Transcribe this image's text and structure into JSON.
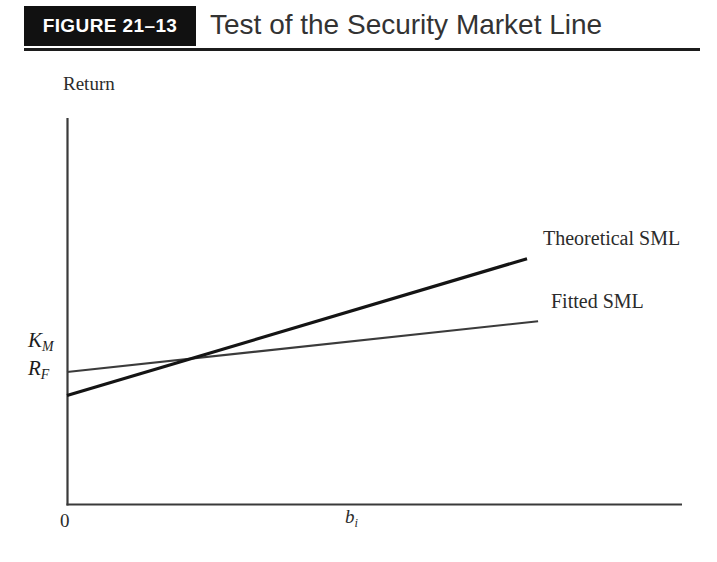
{
  "header": {
    "figure_number": "FIGURE 21–13",
    "title": "Test of the Security Market Line",
    "box_color": "#111111",
    "box_text_color": "#ffffff",
    "title_color": "#333333",
    "rule_color": "#1c1c1c"
  },
  "axes": {
    "y_title": "Return",
    "x_origin_label": "0",
    "x_variable": "b",
    "x_variable_subscript": "i",
    "axis_color": "#3a3a3a"
  },
  "value_labels": [
    {
      "name": "km",
      "symbol": "K",
      "subscript": "M"
    },
    {
      "name": "rf",
      "symbol": "R",
      "subscript": "F"
    }
  ],
  "series_labels": {
    "theoretical": "Theoretical SML",
    "fitted": "Fitted SML"
  },
  "chart_data": {
    "type": "line",
    "title": "Test of the Security Market Line",
    "subtitle": "",
    "xlabel": "b_i",
    "ylabel": "Return",
    "grid": false,
    "legend_position": "right-inline-labels",
    "xlim": [
      0,
      1
    ],
    "ylim": [
      0,
      1
    ],
    "axis_ticks": {
      "x": [
        "0",
        "b_i"
      ],
      "y": [
        "R_F",
        "K_M"
      ]
    },
    "annotations": [
      {
        "text": "Theoretical SML",
        "x": 0.76,
        "y": 0.555
      },
      {
        "text": "Fitted SML",
        "x": 0.79,
        "y": 0.395
      },
      {
        "text": "K_M",
        "x": 0.0,
        "y": 0.343
      },
      {
        "text": "R_F",
        "x": 0.0,
        "y": 0.282
      }
    ],
    "series": [
      {
        "name": "Theoretical SML",
        "color": "#141414",
        "line_width": 3.2,
        "x": [
          0.0,
          0.748
        ],
        "y": [
          0.282,
          0.636
        ],
        "start_value_label": "R_F",
        "description": "Steeper line starting at the risk-free rate R_F on the vertical axis"
      },
      {
        "name": "Fitted SML",
        "color": "#3b3b3b",
        "line_width": 2.1,
        "x": [
          0.0,
          0.766
        ],
        "y": [
          0.343,
          0.474
        ],
        "start_value_label": "K_M",
        "description": "Flatter line starting above R_F, at K_M on the vertical axis"
      }
    ],
    "intersection": {
      "x": 0.281,
      "y": 0.415
    }
  }
}
